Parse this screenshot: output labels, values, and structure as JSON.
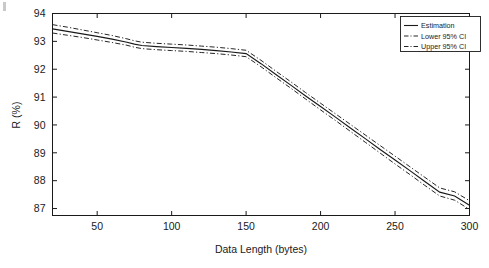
{
  "figure": {
    "background_color": "#ffffff",
    "axis_color": "#1a1a1a",
    "line_color": "#1a1a1a"
  },
  "axes": {
    "x_title": "Data Length (bytes)",
    "y_title": "R (%)",
    "x_ticks": [
      "50",
      "100",
      "150",
      "200",
      "250",
      "300"
    ],
    "y_ticks": [
      "87",
      "88",
      "89",
      "90",
      "91",
      "92",
      "93",
      "94"
    ]
  },
  "legend": {
    "items": [
      {
        "label": "Estimation",
        "style": "solid"
      },
      {
        "label": "Lower 95% CI",
        "style": "dashdot"
      },
      {
        "label": "Upper 95% CI",
        "style": "dashdot"
      }
    ]
  },
  "chart_data": {
    "type": "line",
    "title": "",
    "xlabel": "Data Length (bytes)",
    "ylabel": "R (%)",
    "xlim": [
      20,
      300
    ],
    "ylim": [
      86.75,
      94
    ],
    "xticks": [
      50,
      100,
      150,
      200,
      250,
      300
    ],
    "yticks": [
      87,
      88,
      89,
      90,
      91,
      92,
      93,
      94
    ],
    "grid": false,
    "legend_position": "upper right",
    "x": [
      20,
      30,
      40,
      50,
      60,
      70,
      75,
      80,
      90,
      100,
      110,
      120,
      130,
      140,
      150,
      160,
      170,
      180,
      190,
      200,
      210,
      220,
      230,
      240,
      250,
      260,
      270,
      280,
      290,
      300
    ],
    "series": [
      {
        "name": "Estimation",
        "style": "solid",
        "values": [
          93.45,
          93.36,
          93.27,
          93.18,
          93.08,
          92.97,
          92.9,
          92.85,
          92.81,
          92.78,
          92.75,
          92.71,
          92.67,
          92.62,
          92.56,
          92.2,
          91.81,
          91.43,
          91.04,
          90.66,
          90.28,
          89.89,
          89.51,
          89.12,
          88.74,
          88.36,
          87.97,
          87.59,
          87.45,
          87.12
        ]
      },
      {
        "name": "Lower 95% CI",
        "style": "dashdot",
        "values": [
          93.3,
          93.22,
          93.14,
          93.05,
          92.96,
          92.86,
          92.79,
          92.74,
          92.7,
          92.67,
          92.64,
          92.6,
          92.56,
          92.51,
          92.45,
          92.09,
          91.7,
          91.32,
          90.93,
          90.54,
          90.16,
          89.77,
          89.38,
          88.99,
          88.6,
          88.22,
          87.83,
          87.45,
          87.3,
          86.97
        ]
      },
      {
        "name": "Upper 95% CI",
        "style": "dashdot",
        "values": [
          93.6,
          93.51,
          93.41,
          93.31,
          93.21,
          93.09,
          93.02,
          92.97,
          92.93,
          92.9,
          92.87,
          92.83,
          92.79,
          92.74,
          92.68,
          92.32,
          91.93,
          91.55,
          91.16,
          90.78,
          90.4,
          90.02,
          89.64,
          89.26,
          88.88,
          88.5,
          88.12,
          87.74,
          87.6,
          87.28
        ]
      }
    ]
  }
}
